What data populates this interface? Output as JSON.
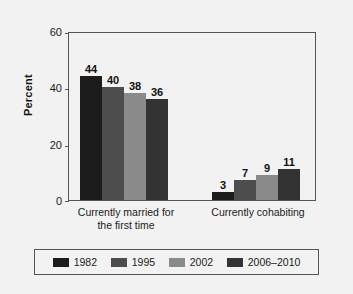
{
  "chart_data": {
    "type": "bar",
    "title": "",
    "xlabel": "",
    "ylabel": "Percent",
    "ylim": [
      0,
      60
    ],
    "yticks": [
      0,
      20,
      40,
      60
    ],
    "ytick_labels": [
      "0",
      "20",
      "40",
      "60"
    ],
    "grid": false,
    "legend_position": "bottom",
    "categories": [
      "Currently married for\nthe first time",
      "Currently cohabiting"
    ],
    "series": [
      {
        "name": "1982",
        "color": "#1c1c1c",
        "values": [
          44,
          3
        ]
      },
      {
        "name": "1995",
        "color": "#4d4d4d",
        "values": [
          40,
          7
        ]
      },
      {
        "name": "2002",
        "color": "#8a8a8a",
        "values": [
          38,
          9
        ]
      },
      {
        "name": "2006–2010",
        "color": "#333333",
        "values": [
          36,
          11
        ]
      }
    ],
    "data_labels": [
      "44",
      "40",
      "38",
      "36",
      "3",
      "7",
      "9",
      "11"
    ]
  },
  "legend": {
    "entries": [
      {
        "label": "1982"
      },
      {
        "label": "1995"
      },
      {
        "label": "2002"
      },
      {
        "label": "2006–2010"
      }
    ]
  },
  "axis": {
    "y_title": "Percent",
    "y_labels": [
      "60",
      "40",
      "20",
      "0"
    ]
  },
  "colors": {
    "background": "#f2f2f2",
    "axis_line": "#555555",
    "text": "#1a1a1a"
  }
}
